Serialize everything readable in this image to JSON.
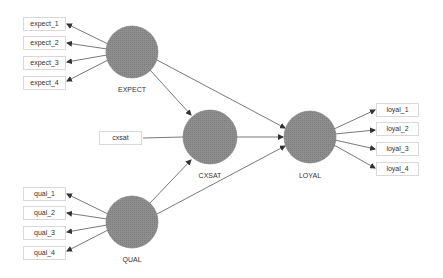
{
  "diagram": {
    "type": "structural-equation-model",
    "colors": {
      "latent_fill": "#8c8c8c",
      "latent_stroke": "#7a7a7a",
      "arrow": "#444444",
      "indicator_border": "#d9d9d9",
      "text": "#333333"
    },
    "latent_variables": [
      {
        "id": "EXPECT",
        "label": "EXPECT",
        "cx": 132,
        "cy": 52,
        "r": 26
      },
      {
        "id": "CXSAT",
        "label": "CXSAT",
        "cx": 210,
        "cy": 137,
        "r": 27
      },
      {
        "id": "LOYAL",
        "label": "LOYAL",
        "cx": 310,
        "cy": 137,
        "r": 26
      },
      {
        "id": "QUAL",
        "label": "QUAL",
        "cx": 132,
        "cy": 222,
        "r": 26
      }
    ],
    "indicators": {
      "expect": [
        "expect_1",
        "expect_2",
        "expect_3",
        "expect_4"
      ],
      "qual": [
        "qual_1",
        "qual_2",
        "qual_3",
        "qual_4"
      ],
      "loyal": [
        "loyal_1",
        "loyal_2",
        "loyal_3",
        "loyal_4"
      ],
      "cxsat": "cxsat"
    },
    "paths": [
      {
        "from": "EXPECT",
        "to": "CXSAT"
      },
      {
        "from": "EXPECT",
        "to": "LOYAL"
      },
      {
        "from": "QUAL",
        "to": "CXSAT"
      },
      {
        "from": "QUAL",
        "to": "LOYAL"
      },
      {
        "from": "CXSAT",
        "to": "LOYAL"
      },
      {
        "from": "cxsat",
        "to": "CXSAT"
      }
    ]
  }
}
